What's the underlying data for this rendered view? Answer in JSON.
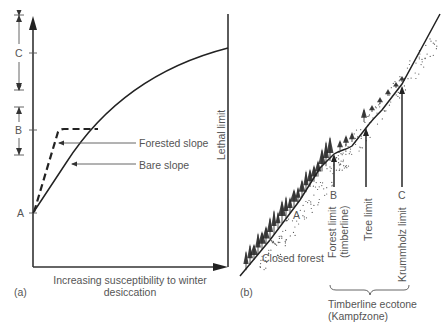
{
  "panel_a": {
    "label": "(a)",
    "x_axis_label_line1": "Increasing susceptibility to winter",
    "x_axis_label_line2": "desiccation",
    "vertical_line_label": "Lethal limit",
    "ticks": [
      "A",
      "B",
      "C"
    ],
    "brackets": [
      "B",
      "C"
    ],
    "curves": [
      {
        "name": "Forested slope",
        "style": "dashed"
      },
      {
        "name": "Bare slope",
        "style": "solid"
      }
    ]
  },
  "panel_b": {
    "label": "(b)",
    "slope_labels": {
      "closed_forest": "Closed forest",
      "point_a": "A"
    },
    "markers": [
      {
        "letter": "B",
        "line1": "Forest limit",
        "line2": "(timberline)"
      },
      {
        "letter": "",
        "line1": "Tree limit",
        "line2": ""
      },
      {
        "letter": "C",
        "line1": "Krummholz limit",
        "line2": ""
      }
    ],
    "brace_label_line1": "Timberline ecotone",
    "brace_label_line2": "(Kampfzone)"
  }
}
